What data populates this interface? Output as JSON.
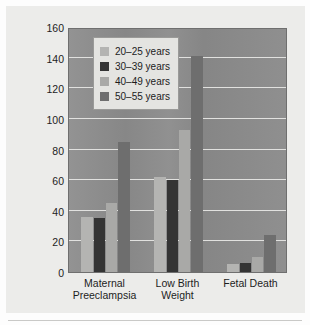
{
  "chart_data": {
    "type": "bar",
    "title": "",
    "subtitle": "",
    "xlabel": "",
    "ylabel": "Rate per 1,000 Deliveries",
    "categories": [
      "Maternal\nPreeclampsia",
      "Low Birth\nWeight",
      "Fetal Death"
    ],
    "series": [
      {
        "name": "20–25 years",
        "color": "#b4b4b2",
        "values": [
          36,
          62,
          5
        ]
      },
      {
        "name": "30–39 years",
        "color": "#343434",
        "values": [
          35,
          60,
          6
        ]
      },
      {
        "name": "40–49 years",
        "color": "#a9a9a7",
        "values": [
          45,
          93,
          10
        ]
      },
      {
        "name": "50–55 years",
        "color": "#6e6e6e",
        "values": [
          85,
          141,
          24
        ]
      }
    ],
    "ylim": [
      0,
      160
    ],
    "yticks": [
      0,
      20,
      40,
      60,
      80,
      100,
      120,
      140,
      160
    ],
    "ytick_labels": [
      "0",
      "20",
      "40",
      "60",
      "80",
      "100",
      "120",
      "140",
      "160"
    ],
    "grid": true,
    "grid_color": "#e8e8e6",
    "legend_position": "upper left inside",
    "plot_background": "#8d8d8d",
    "figure_background": "#ececea"
  }
}
